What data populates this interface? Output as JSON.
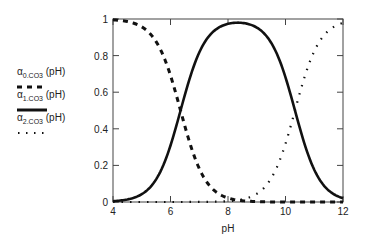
{
  "chart_data": {
    "type": "line",
    "title": "",
    "xlabel": "pH",
    "ylabel": "",
    "xlim": [
      4,
      12
    ],
    "ylim": [
      0,
      1
    ],
    "x_ticks": [
      "4",
      "6",
      "8",
      "10",
      "12"
    ],
    "y_ticks": [
      "0",
      "0.2",
      "0.4",
      "0.6",
      "0.8",
      "1"
    ],
    "grid": false,
    "legend_position": "left",
    "pKa1": 6.35,
    "pKa2": 10.33,
    "x": [
      4,
      4.5,
      5,
      5.5,
      6,
      6.35,
      6.5,
      7,
      7.5,
      8,
      8.3,
      8.5,
      9,
      9.5,
      10,
      10.33,
      10.5,
      11,
      11.5,
      12
    ],
    "series": [
      {
        "name": "α0.CO3 (pH)",
        "style": "dashed",
        "values": [
          0.996,
          0.986,
          0.957,
          0.876,
          0.691,
          0.5,
          0.414,
          0.183,
          0.066,
          0.022,
          0.011,
          0.007,
          0.002,
          0.001,
          0.0,
          0.0,
          0.0,
          0.0,
          0.0,
          0.0
        ]
      },
      {
        "name": "α1.CO3 (pH)",
        "style": "solid",
        "values": [
          0.004,
          0.014,
          0.043,
          0.124,
          0.309,
          0.5,
          0.585,
          0.815,
          0.929,
          0.967,
          0.978,
          0.978,
          0.954,
          0.872,
          0.682,
          0.5,
          0.403,
          0.176,
          0.063,
          0.021
        ]
      },
      {
        "name": "α2.CO3 (pH)",
        "style": "dotted",
        "values": [
          0.0,
          0.0,
          0.0,
          0.0,
          0.0,
          0.0,
          0.001,
          0.002,
          0.005,
          0.011,
          0.011,
          0.016,
          0.045,
          0.128,
          0.318,
          0.5,
          0.597,
          0.824,
          0.937,
          0.979
        ]
      }
    ]
  },
  "legend": {
    "items": [
      {
        "symbol": "α",
        "sub": "0.CO3",
        "suffix": " (pH)"
      },
      {
        "symbol": "α",
        "sub": "1.CO3",
        "suffix": " (pH)"
      },
      {
        "symbol": "α",
        "sub": "2.CO3",
        "suffix": " (pH)"
      }
    ]
  }
}
